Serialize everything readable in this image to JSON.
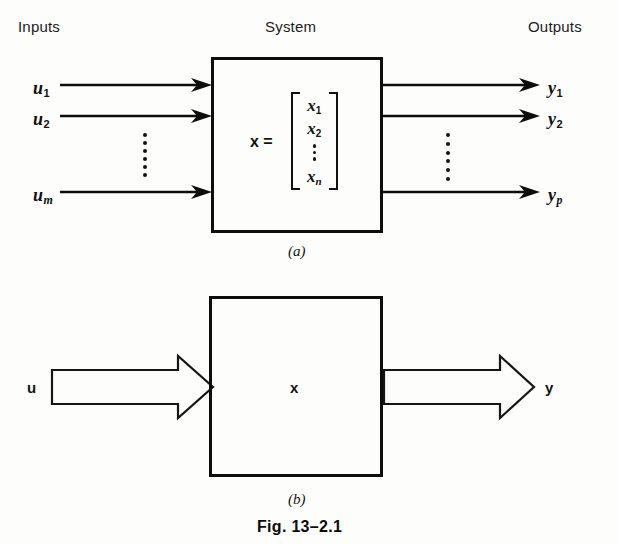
{
  "figure": {
    "caption": "Fig. 13–2.1",
    "panel_a_label": "(a)",
    "panel_b_label": "(b)"
  },
  "panel_a": {
    "headers": {
      "inputs": "Inputs",
      "system": "System",
      "outputs": "Outputs"
    },
    "inputs": [
      {
        "base": "u",
        "sub": "1",
        "sub_italic": false
      },
      {
        "base": "u",
        "sub": "2",
        "sub_italic": false
      },
      {
        "base": "u",
        "sub": "m",
        "sub_italic": true
      }
    ],
    "input_ellipsis": "⋮",
    "outputs": [
      {
        "base": "y",
        "sub": "1",
        "sub_italic": false
      },
      {
        "base": "y",
        "sub": "2",
        "sub_italic": false
      },
      {
        "base": "y",
        "sub": "p",
        "sub_italic": true
      }
    ],
    "output_ellipsis": "⋮",
    "state": {
      "equation_label": "x =",
      "elements": [
        {
          "base": "x",
          "sub": "1",
          "sub_italic": false
        },
        {
          "base": "x",
          "sub": "2",
          "sub_italic": false
        },
        {
          "base": "x",
          "sub": "n",
          "sub_italic": true
        }
      ],
      "ellipsis": "⋮",
      "bracket_left": "[",
      "bracket_right": "]"
    }
  },
  "panel_b": {
    "input_label": "u",
    "state_label": "x",
    "output_label": "y"
  },
  "colors": {
    "ink": "#0d0d0d",
    "paper": "#fdfdfc"
  }
}
